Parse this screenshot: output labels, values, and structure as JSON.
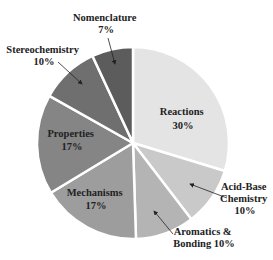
{
  "chart_data": {
    "type": "pie",
    "title": "",
    "start_angle_deg": 0,
    "direction": "clockwise",
    "slices": [
      {
        "label": "Reactions",
        "value": 30,
        "pct_text": "30%",
        "color": "#e4e4e4"
      },
      {
        "label": "Acid-Base Chemistry",
        "value": 10,
        "pct_text": "10%",
        "color": "#c9c9c9"
      },
      {
        "label": "Aromatics & Bonding",
        "value": 10,
        "pct_text": "10%",
        "color": "#b4b4b4"
      },
      {
        "label": "Mechanisms",
        "value": 17,
        "pct_text": "17%",
        "color": "#9d9d9d"
      },
      {
        "label": "Properties",
        "value": 17,
        "pct_text": "17%",
        "color": "#858585"
      },
      {
        "label": "Stereochemistry",
        "value": 10,
        "pct_text": "10%",
        "color": "#6f6f6f"
      },
      {
        "label": "Nomenclature",
        "value": 7,
        "pct_text": "7%",
        "color": "#5c5c5c"
      }
    ],
    "legend": "none (direct labels)"
  },
  "labels": {
    "reactions": {
      "line1": "Reactions",
      "line2": "30%"
    },
    "acid_base": {
      "line1": "Acid-Base",
      "line2": "Chemistry",
      "line3": "10%"
    },
    "aromatics": {
      "line1": "Aromatics &",
      "line2": "Bonding 10%"
    },
    "mechanisms": {
      "line1": "Mechanisms",
      "line2": "17%"
    },
    "properties": {
      "line1": "Properties",
      "line2": "17%"
    },
    "stereo": {
      "line1": "Stereochemistry",
      "line2": "10%"
    },
    "nomenclature": {
      "line1": "Nomenclature",
      "line2": "7%"
    }
  }
}
